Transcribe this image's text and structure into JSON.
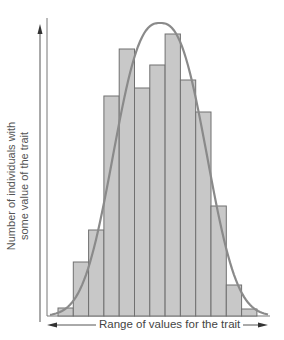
{
  "chart_data": {
    "type": "bar",
    "title": "",
    "xlabel": "Range of values for the trait",
    "ylabel_lines": [
      "Number of individuals with",
      "some value of the trait"
    ],
    "ylabel": "Number of individuals with some value of the trait",
    "categories": [
      "1",
      "2",
      "3",
      "4",
      "5",
      "6",
      "7",
      "8",
      "9",
      "10",
      "11",
      "12",
      "13"
    ],
    "values": [
      8,
      54,
      86,
      220,
      267,
      228,
      251,
      282,
      236,
      204,
      110,
      31,
      7
    ],
    "overlay": {
      "type": "line",
      "name": "bell curve (normal distribution fit)",
      "shape": "bell",
      "peak_category_index": 6.9,
      "peak_value": 293
    },
    "ylim": [
      0,
      300
    ],
    "grid": false,
    "legend": "none",
    "ticks": "none",
    "colors": {
      "bar_fill": "#c8c8c8",
      "bar_stroke": "#707070",
      "curve": "#8a8a8a",
      "axis": "#555555"
    }
  },
  "labels": {
    "y_line1": "Number of individuals with",
    "y_line2": "some value of the trait",
    "x": "Range of values for the trait"
  }
}
